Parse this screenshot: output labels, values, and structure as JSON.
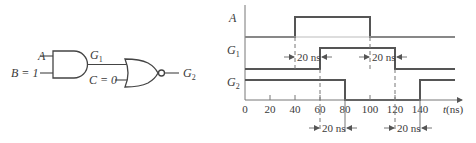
{
  "circuit": {
    "inputs": [
      {
        "name": "A",
        "label": "A"
      },
      {
        "name": "B",
        "label": "B = 1"
      },
      {
        "name": "C",
        "label": "C = 0"
      }
    ],
    "gates": [
      {
        "id": "G1",
        "type": "AND",
        "label_main": "G",
        "label_sub": "1"
      },
      {
        "id": "G2",
        "type": "NOR",
        "label_main": "G",
        "label_sub": "2"
      }
    ]
  },
  "timing": {
    "signals": [
      {
        "name": "A",
        "label_main": "A",
        "label_sub": "",
        "high_intervals": [
          [
            40,
            100
          ]
        ]
      },
      {
        "name": "G1",
        "label_main": "G",
        "label_sub": "1",
        "high_intervals": [
          [
            60,
            120
          ]
        ]
      },
      {
        "name": "G2",
        "label_main": "G",
        "label_sub": "2",
        "high_intervals": [
          [
            0,
            80
          ],
          [
            140,
            160
          ]
        ]
      }
    ],
    "axis": {
      "ticks": [
        "0",
        "20",
        "40",
        "60",
        "80",
        "100",
        "120",
        "140"
      ],
      "label": "t(ns)",
      "label_t": "t",
      "label_unit": "(ns)"
    },
    "delays": [
      {
        "label": "20 ns",
        "from": 40,
        "to": 60,
        "row": "G1"
      },
      {
        "label": "20 ns",
        "from": 100,
        "to": 120,
        "row": "G1"
      },
      {
        "label": "20 ns",
        "from": 60,
        "to": 80,
        "row": "bottom"
      },
      {
        "label": "20 ns",
        "from": 120,
        "to": 140,
        "row": "bottom"
      }
    ]
  }
}
